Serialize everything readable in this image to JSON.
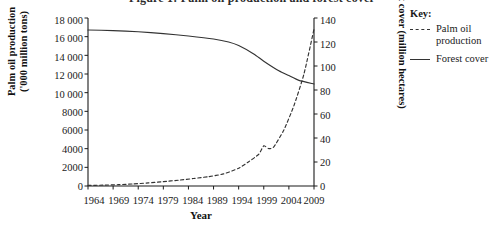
{
  "title": "Figure 1: Palm oil production and forest cover",
  "axes": {
    "xlabel": "Year",
    "ylabel_left": "Palm oil production\n('000 million tons)",
    "ylabel_right": "Forest cover (million hectares)",
    "left_ticks": [
      "18 000",
      "16 000",
      "14 000",
      "12 000",
      "10 000",
      "8000",
      "6000",
      "4000",
      "2000",
      "0"
    ],
    "right_ticks": [
      "140",
      "120",
      "100",
      "80",
      "60",
      "40",
      "20",
      "0"
    ],
    "x_ticks": [
      "1964",
      "1969",
      "1974",
      "1979",
      "1984",
      "1989",
      "1994",
      "1999",
      "2004",
      "2009"
    ]
  },
  "legend": {
    "title": "Key:",
    "items": [
      {
        "label": "Palm oil\nproduction",
        "style": "dashed"
      },
      {
        "label": "Forest cover",
        "style": "solid"
      }
    ]
  },
  "colors": {
    "line": "#333333",
    "axis": "#1a1a1a",
    "background": "#ffffff"
  },
  "chart_data": {
    "type": "line",
    "title": "Figure 1: Palm oil production and forest cover",
    "xlabel": "Year",
    "ylabel": "Palm oil production ('000 million tons)",
    "ylabel_secondary": "Forest cover (million hectares)",
    "xlim": [
      1964,
      2009
    ],
    "ylim": [
      0,
      18000
    ],
    "ylim_secondary": [
      0,
      140
    ],
    "grid": false,
    "legend_position": "right",
    "x": [
      1964,
      1969,
      1974,
      1979,
      1984,
      1989,
      1994,
      1999,
      2004,
      2009
    ],
    "series": [
      {
        "name": "Palm oil production",
        "axis": "left",
        "style": "dashed",
        "units": "'000 million tons",
        "x": [
          1964,
          1967,
          1970,
          1973,
          1976,
          1979,
          1982,
          1985,
          1988,
          1991,
          1994,
          1996,
          1998,
          1999,
          2000,
          2001,
          2003,
          2005,
          2007,
          2009
        ],
        "values": [
          60,
          90,
          140,
          220,
          330,
          470,
          620,
          800,
          1000,
          1300,
          1900,
          2600,
          3400,
          4300,
          4000,
          4200,
          6000,
          8600,
          12000,
          16800
        ]
      },
      {
        "name": "Forest cover",
        "axis": "right",
        "style": "solid",
        "units": "million hectares",
        "x": [
          1964,
          1969,
          1974,
          1979,
          1984,
          1989,
          1992,
          1994,
          1997,
          1999,
          2002,
          2004,
          2006,
          2009
        ],
        "values": [
          130,
          129.5,
          128.5,
          127,
          125,
          122.5,
          120,
          117,
          110,
          104,
          96,
          92,
          88,
          85
        ]
      }
    ],
    "annotations": [
      "Palm oil production rises slowly until about 1989 then climbs steeply, with a brief plateau around 1999-2001.",
      "Forest cover declines gently until about 1990 and then falls sharply.",
      "The two curves cross at approximately 2006."
    ]
  }
}
